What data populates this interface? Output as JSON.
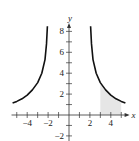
{
  "chart_data": {
    "type": "line",
    "title": "",
    "xlabel": "x",
    "ylabel": "y",
    "xlim": [
      -5.5,
      5.8
    ],
    "ylim": [
      -2.5,
      8.8
    ],
    "x_ticks": [
      -5,
      -4,
      -3,
      -2,
      -1,
      1,
      2,
      3,
      4,
      5
    ],
    "x_tick_labels": [
      "-4",
      "-2",
      "2",
      "4"
    ],
    "x_tick_label_values": [
      -4,
      -2,
      2,
      4
    ],
    "y_ticks": [
      -2,
      -1,
      1,
      2,
      3,
      4,
      5,
      6,
      7,
      8
    ],
    "y_tick_labels": [
      "8",
      "6",
      "4",
      "2",
      "-2"
    ],
    "y_tick_label_values": [
      8,
      6,
      4,
      2,
      -2
    ],
    "grid": false,
    "series": [
      {
        "name": "left branch",
        "x": [
          -5.4,
          -5.0,
          -4.5,
          -4.0,
          -3.5,
          -3.0,
          -2.6,
          -2.3,
          -2.15,
          -2.07
        ],
        "y": [
          1.15,
          1.3,
          1.55,
          1.9,
          2.4,
          3.1,
          4.0,
          5.3,
          6.8,
          8.5
        ]
      },
      {
        "name": "right branch",
        "x": [
          2.07,
          2.15,
          2.3,
          2.6,
          3.0,
          3.5,
          4.0,
          4.5,
          5.0,
          5.4
        ],
        "y": [
          8.5,
          6.8,
          5.3,
          4.0,
          3.1,
          2.4,
          1.9,
          1.55,
          1.3,
          1.15
        ]
      }
    ],
    "shaded_region": {
      "x_from": 3,
      "x_to": 5,
      "between": "x-axis and right branch",
      "color": "#e6e6e6"
    },
    "curve_color": "#111111",
    "axis_color": "#333333"
  }
}
